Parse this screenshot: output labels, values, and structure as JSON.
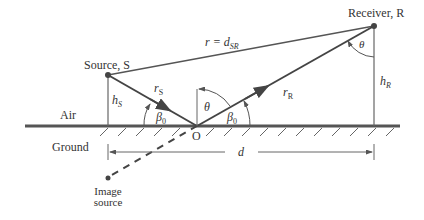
{
  "diagram": {
    "labels": {
      "source": "Source, S",
      "receiver": "Receiver, R",
      "direct_path": "r = d",
      "direct_path_sub": "SR",
      "r_s": "r",
      "r_s_sub": "S",
      "r_r": "r",
      "r_r_sub": "R",
      "h_s": "h",
      "h_s_sub": "S",
      "h_r": "h",
      "h_r_sub": "R",
      "theta_o": "θ",
      "theta_r": "θ",
      "beta_left": "β",
      "beta_left_sub": "0",
      "beta_right": "β",
      "beta_right_sub": "0",
      "reflection_point": "O",
      "distance": "d",
      "air": "Air",
      "ground": "Ground",
      "image_source_line1": "Image",
      "image_source_line2": "source"
    },
    "colors": {
      "line": "#555555",
      "ray": "#444444",
      "text": "#333333"
    }
  }
}
